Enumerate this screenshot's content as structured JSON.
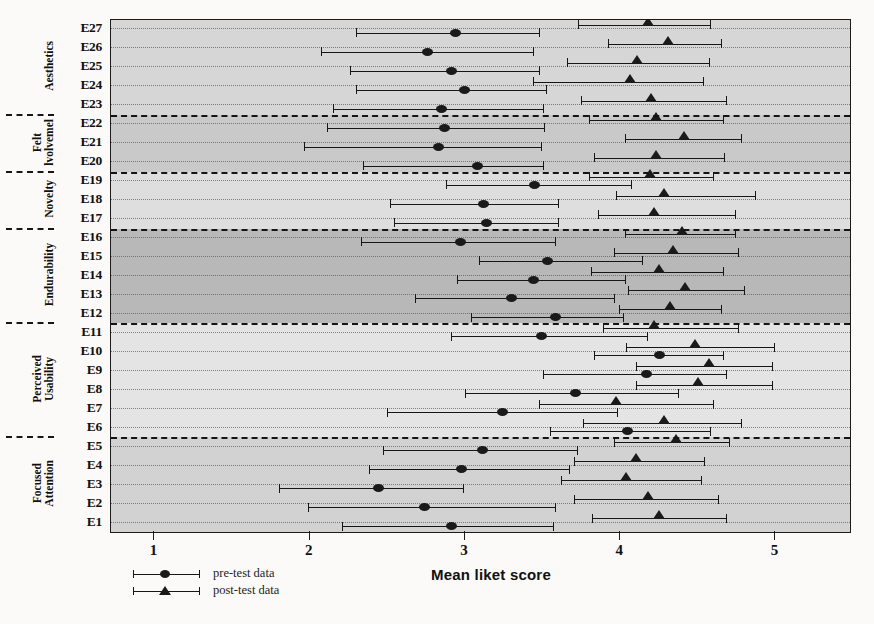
{
  "chart_data": {
    "type": "scatter",
    "title": "",
    "xlabel": "Mean liket score",
    "ylabel": "",
    "xlim": [
      0.72,
      5.48
    ],
    "xticks": [
      1,
      2,
      3,
      4,
      5
    ],
    "xticklabels": [
      "1",
      "2",
      "3",
      "4",
      "5"
    ],
    "grid": true,
    "legend_position": "below-left",
    "orientation": "horizontal",
    "series": [
      {
        "name": "pre-test data",
        "marker": "circle"
      },
      {
        "name": "post-test data",
        "marker": "triangle"
      }
    ],
    "groups": [
      {
        "label": "Aesthetics",
        "items": [
          "E23",
          "E24",
          "E25",
          "E26",
          "E27"
        ],
        "shade": "#d6d6d6"
      },
      {
        "label": "Felt Involvement",
        "items": [
          "E20",
          "E21",
          "E22"
        ],
        "shade": "#c9c9c9"
      },
      {
        "label": "Novelty",
        "items": [
          "E17",
          "E18",
          "E19"
        ],
        "shade": "#dedede"
      },
      {
        "label": "Endurability",
        "items": [
          "E12",
          "E13",
          "E14",
          "E15",
          "E16"
        ],
        "shade": "#b8b8b8"
      },
      {
        "label": "Perceived Usability",
        "items": [
          "E6",
          "E7",
          "E8",
          "E9",
          "E10",
          "E11"
        ],
        "shade": "#e4e4e4"
      },
      {
        "label": "Focused Attention",
        "items": [
          "E1",
          "E2",
          "E3",
          "E4",
          "E5"
        ],
        "shade": "#d2d2d2"
      }
    ],
    "categories": [
      "E27",
      "E26",
      "E25",
      "E24",
      "E23",
      "E22",
      "E21",
      "E20",
      "E19",
      "E18",
      "E17",
      "E16",
      "E15",
      "E14",
      "E13",
      "E12",
      "E11",
      "E10",
      "E9",
      "E8",
      "E7",
      "E6",
      "E5",
      "E4",
      "E3",
      "E2",
      "E1"
    ],
    "rows": [
      {
        "item": "E27",
        "pre": {
          "mean": 2.94,
          "low": 2.3,
          "high": 3.48
        },
        "post": {
          "mean": 4.18,
          "low": 3.73,
          "high": 4.58
        }
      },
      {
        "item": "E26",
        "pre": {
          "mean": 2.76,
          "low": 2.07,
          "high": 3.44
        },
        "post": {
          "mean": 4.31,
          "low": 3.92,
          "high": 4.65
        }
      },
      {
        "item": "E25",
        "pre": {
          "mean": 2.91,
          "low": 2.26,
          "high": 3.48
        },
        "post": {
          "mean": 4.11,
          "low": 3.66,
          "high": 4.57
        }
      },
      {
        "item": "E24",
        "pre": {
          "mean": 3.0,
          "low": 2.3,
          "high": 3.52
        },
        "post": {
          "mean": 4.06,
          "low": 3.44,
          "high": 4.53
        }
      },
      {
        "item": "E23",
        "pre": {
          "mean": 2.85,
          "low": 2.15,
          "high": 3.5
        },
        "post": {
          "mean": 4.2,
          "low": 3.75,
          "high": 4.68
        }
      },
      {
        "item": "E22",
        "pre": {
          "mean": 2.87,
          "low": 2.11,
          "high": 3.51
        },
        "post": {
          "mean": 4.23,
          "low": 3.8,
          "high": 4.66
        }
      },
      {
        "item": "E21",
        "pre": {
          "mean": 2.83,
          "low": 1.96,
          "high": 3.49
        },
        "post": {
          "mean": 4.41,
          "low": 4.03,
          "high": 4.78
        }
      },
      {
        "item": "E20",
        "pre": {
          "mean": 3.08,
          "low": 2.34,
          "high": 3.5
        },
        "post": {
          "mean": 4.23,
          "low": 3.83,
          "high": 4.67
        }
      },
      {
        "item": "E19",
        "pre": {
          "mean": 3.45,
          "low": 2.88,
          "high": 4.07
        },
        "post": {
          "mean": 4.19,
          "low": 3.8,
          "high": 4.6
        }
      },
      {
        "item": "E18",
        "pre": {
          "mean": 3.12,
          "low": 2.52,
          "high": 3.6
        },
        "post": {
          "mean": 4.28,
          "low": 3.97,
          "high": 4.87
        }
      },
      {
        "item": "E17",
        "pre": {
          "mean": 3.14,
          "low": 2.54,
          "high": 3.6
        },
        "post": {
          "mean": 4.22,
          "low": 3.86,
          "high": 4.74
        }
      },
      {
        "item": "E16",
        "pre": {
          "mean": 2.97,
          "low": 2.33,
          "high": 3.58
        },
        "post": {
          "mean": 4.4,
          "low": 4.03,
          "high": 4.74
        }
      },
      {
        "item": "E15",
        "pre": {
          "mean": 3.53,
          "low": 3.09,
          "high": 4.14
        },
        "post": {
          "mean": 4.34,
          "low": 3.96,
          "high": 4.76
        }
      },
      {
        "item": "E14",
        "pre": {
          "mean": 3.44,
          "low": 2.95,
          "high": 4.03
        },
        "post": {
          "mean": 4.25,
          "low": 3.81,
          "high": 4.66
        }
      },
      {
        "item": "E13",
        "pre": {
          "mean": 3.3,
          "low": 2.68,
          "high": 3.96
        },
        "post": {
          "mean": 4.42,
          "low": 4.05,
          "high": 4.8
        }
      },
      {
        "item": "E12",
        "pre": {
          "mean": 3.58,
          "low": 3.04,
          "high": 4.02
        },
        "post": {
          "mean": 4.32,
          "low": 3.99,
          "high": 4.65
        }
      },
      {
        "item": "E11",
        "pre": {
          "mean": 3.49,
          "low": 2.91,
          "high": 4.17
        },
        "post": {
          "mean": 4.22,
          "low": 3.89,
          "high": 4.76
        }
      },
      {
        "item": "E10",
        "pre": {
          "mean": 4.25,
          "low": 3.83,
          "high": 4.66
        },
        "post": {
          "mean": 4.48,
          "low": 4.04,
          "high": 4.99
        }
      },
      {
        "item": "E9",
        "pre": {
          "mean": 4.17,
          "low": 3.5,
          "high": 4.68
        },
        "post": {
          "mean": 4.57,
          "low": 4.1,
          "high": 4.98
        }
      },
      {
        "item": "E8",
        "pre": {
          "mean": 3.71,
          "low": 3.0,
          "high": 4.37
        },
        "post": {
          "mean": 4.5,
          "low": 4.1,
          "high": 4.98
        }
      },
      {
        "item": "E7",
        "pre": {
          "mean": 3.24,
          "low": 2.5,
          "high": 3.98
        },
        "post": {
          "mean": 3.97,
          "low": 3.48,
          "high": 4.6
        }
      },
      {
        "item": "E6",
        "pre": {
          "mean": 4.05,
          "low": 3.55,
          "high": 4.58
        },
        "post": {
          "mean": 4.28,
          "low": 3.76,
          "high": 4.78
        }
      },
      {
        "item": "E5",
        "pre": {
          "mean": 3.11,
          "low": 2.47,
          "high": 3.72
        },
        "post": {
          "mean": 4.36,
          "low": 3.96,
          "high": 4.7
        }
      },
      {
        "item": "E4",
        "pre": {
          "mean": 2.98,
          "low": 2.38,
          "high": 3.67
        },
        "post": {
          "mean": 4.1,
          "low": 3.7,
          "high": 4.54
        }
      },
      {
        "item": "E3",
        "pre": {
          "mean": 2.44,
          "low": 1.8,
          "high": 2.99
        },
        "post": {
          "mean": 4.04,
          "low": 3.62,
          "high": 4.52
        }
      },
      {
        "item": "E2",
        "pre": {
          "mean": 2.74,
          "low": 1.99,
          "high": 3.58
        },
        "post": {
          "mean": 4.18,
          "low": 3.7,
          "high": 4.63
        }
      },
      {
        "item": "E1",
        "pre": {
          "mean": 2.91,
          "low": 2.21,
          "high": 3.57
        },
        "post": {
          "mean": 4.25,
          "low": 3.82,
          "high": 4.68
        }
      }
    ]
  },
  "axis": {
    "x_title": "Mean liket score",
    "tick_labels": [
      "1",
      "2",
      "3",
      "4",
      "5"
    ]
  },
  "legend": {
    "pre_label": "pre-test data",
    "post_label": "post-test data"
  },
  "group_labels": {
    "aesthetics": "Aesthetics",
    "felt": "Felt",
    "involvement": "lvolvemel",
    "novelty": "Novelty",
    "endurability": "Endurability",
    "perceived": "Perceived",
    "usability": "Usability",
    "focused": "Focused",
    "attention": "Attention"
  },
  "colors": {
    "ink": "#1a1a1a",
    "plot_bg": "#d9d9d9",
    "band_dark": "#b8b8b8",
    "band_light": "#e4e4e4"
  }
}
